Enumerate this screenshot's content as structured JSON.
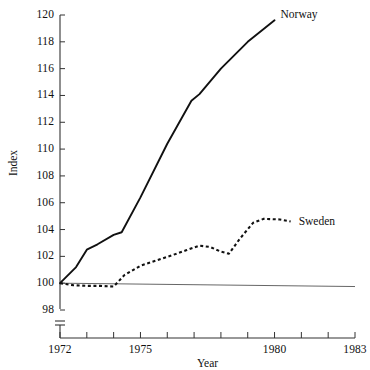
{
  "chart_data": {
    "type": "line",
    "title": "",
    "xlabel": "Year",
    "ylabel": "Index",
    "xlim": [
      1972,
      1983
    ],
    "ylim": [
      98,
      120
    ],
    "grid": false,
    "axis_break": true,
    "axis_break_note": "y-axis broken below 98",
    "legend_position": "inline-right-of-line-end",
    "x_tick_labels": [
      "1972",
      "1975",
      "1980",
      "1983"
    ],
    "x_tick_values": [
      1972,
      1975,
      1980,
      1983
    ],
    "x_minor_ticks": [
      1972,
      1973,
      1974,
      1975,
      1976,
      1977,
      1978,
      1979,
      1980,
      1981,
      1982,
      1983
    ],
    "y_tick_labels": [
      "98",
      "100",
      "102",
      "104",
      "106",
      "108",
      "110",
      "112",
      "114",
      "116",
      "118",
      "120"
    ],
    "y_tick_values": [
      98,
      100,
      102,
      104,
      106,
      108,
      110,
      112,
      114,
      116,
      118,
      120
    ],
    "reference_line": {
      "name": "baseline-100",
      "y_start": 100.0,
      "y_end": 99.75,
      "x_start": 1972,
      "x_end": 1983,
      "style": "thin-solid"
    },
    "series": [
      {
        "name": "Norway",
        "style": "solid",
        "color": "#111111",
        "x": [
          1972,
          1972.6,
          1973.0,
          1973.4,
          1974.0,
          1974.3,
          1975.0,
          1976.0,
          1976.9,
          1977.2,
          1978.0,
          1979.0,
          1980.0
        ],
        "values": [
          100.0,
          101.2,
          102.5,
          102.9,
          103.6,
          103.8,
          106.4,
          110.4,
          113.6,
          114.1,
          116.0,
          118.0,
          119.6
        ],
        "label_text": "Norway"
      },
      {
        "name": "Sweden",
        "style": "dashed",
        "color": "#111111",
        "x": [
          1972,
          1972.5,
          1973.0,
          1973.5,
          1974.0,
          1974.4,
          1975.0,
          1975.6,
          1976.2,
          1976.7,
          1977.2,
          1977.6,
          1978.0,
          1978.3,
          1978.7,
          1979.2,
          1979.6,
          1980.2,
          1980.6
        ],
        "values": [
          100.0,
          99.85,
          99.8,
          99.8,
          99.75,
          100.6,
          101.3,
          101.7,
          102.1,
          102.45,
          102.8,
          102.7,
          102.35,
          102.2,
          103.3,
          104.5,
          104.8,
          104.75,
          104.6
        ],
        "label_text": "Sweden"
      }
    ]
  },
  "axis": {
    "y_title": "Index",
    "x_title": "Year"
  },
  "labels": {
    "norway": "Norway",
    "sweden": "Sweden"
  }
}
